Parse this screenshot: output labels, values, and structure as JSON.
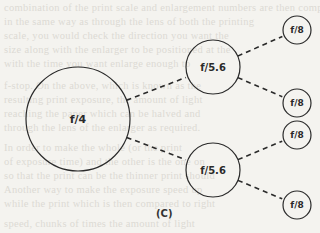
{
  "diagram": {
    "caption": "(C)",
    "nodes": [
      {
        "id": "root",
        "label": "f/4",
        "cx": 78,
        "cy": 119,
        "r": 52,
        "font_size": 11
      },
      {
        "id": "mid-upper",
        "label": "f/5.6",
        "cx": 213,
        "cy": 67,
        "r": 27,
        "font_size": 10
      },
      {
        "id": "mid-lower",
        "label": "f/5.6",
        "cx": 213,
        "cy": 170,
        "r": 27,
        "font_size": 10
      },
      {
        "id": "leaf-1",
        "label": "f/8",
        "cx": 297,
        "cy": 30,
        "r": 14,
        "font_size": 9
      },
      {
        "id": "leaf-2",
        "label": "f/8",
        "cx": 297,
        "cy": 103,
        "r": 14,
        "font_size": 9
      },
      {
        "id": "leaf-3",
        "label": "f/8",
        "cx": 297,
        "cy": 135,
        "r": 14,
        "font_size": 9
      },
      {
        "id": "leaf-4",
        "label": "f/8",
        "cx": 297,
        "cy": 205,
        "r": 14,
        "font_size": 9
      }
    ],
    "edges": [
      {
        "from": "root",
        "to": "mid-upper",
        "style": "dashed"
      },
      {
        "from": "root",
        "to": "mid-lower",
        "style": "dashed"
      },
      {
        "from": "mid-upper",
        "to": "leaf-1",
        "style": "dashed"
      },
      {
        "from": "mid-upper",
        "to": "leaf-2",
        "style": "dashed"
      },
      {
        "from": "mid-lower",
        "to": "leaf-3",
        "style": "dashed"
      },
      {
        "from": "mid-lower",
        "to": "leaf-4",
        "style": "dashed"
      }
    ],
    "line_color": "#2a2a2a"
  }
}
